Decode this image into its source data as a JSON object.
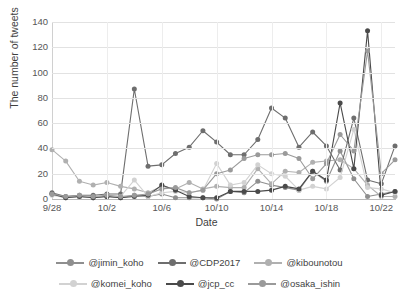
{
  "chart_data": {
    "type": "line",
    "title": "",
    "xlabel": "Date",
    "ylabel": "The number of tweets",
    "ylim": [
      0,
      140
    ],
    "ytick_values": [
      0,
      20,
      40,
      60,
      80,
      100,
      120,
      140
    ],
    "ytick_labels": [
      "0",
      "20",
      "40",
      "60",
      "80",
      "100",
      "120",
      "140"
    ],
    "grid": true,
    "grid_axis": "both",
    "legend_position": "bottom",
    "x": [
      "9/28",
      "9/29",
      "9/30",
      "10/1",
      "10/2",
      "10/3",
      "10/4",
      "10/5",
      "10/6",
      "10/7",
      "10/8",
      "10/9",
      "10/10",
      "10/11",
      "10/12",
      "10/13",
      "10/14",
      "10/15",
      "10/16",
      "10/17",
      "10/18",
      "10/19",
      "10/20",
      "10/21",
      "10/22",
      "10/23"
    ],
    "xtick_labels": [
      "9/28",
      "10/2",
      "10/6",
      "10/10",
      "10/14",
      "10/18",
      "10/22"
    ],
    "xtick_indices": [
      0,
      4,
      8,
      12,
      16,
      20,
      24
    ],
    "series": [
      {
        "name": "@jimin_koho",
        "color": "#8f8f8f",
        "values": [
          4,
          1,
          2,
          1,
          2,
          1,
          3,
          2,
          4,
          1,
          1,
          1,
          0,
          6,
          5,
          14,
          11,
          9,
          7,
          22,
          14,
          38,
          16,
          2,
          4,
          6
        ]
      },
      {
        "name": "@CDP2017",
        "color": "#6e6e6e",
        "values": [
          5,
          2,
          3,
          3,
          4,
          4,
          87,
          26,
          27,
          36,
          41,
          54,
          45,
          35,
          35,
          47,
          72,
          64,
          41,
          53,
          42,
          23,
          64,
          15,
          12,
          42
        ]
      },
      {
        "name": "@kibounotou",
        "color": "#b0b0b0",
        "values": [
          39,
          30,
          14,
          11,
          13,
          10,
          8,
          5,
          10,
          8,
          13,
          8,
          10,
          9,
          9,
          24,
          12,
          22,
          21,
          29,
          30,
          31,
          24,
          11,
          2,
          2
        ]
      },
      {
        "name": "@komei_koho",
        "color": "#d2d2d2",
        "values": [
          3,
          1,
          2,
          1,
          3,
          2,
          15,
          2,
          5,
          6,
          5,
          7,
          28,
          11,
          13,
          27,
          20,
          18,
          7,
          10,
          8,
          17,
          55,
          9,
          8,
          5
        ]
      },
      {
        "name": "@jcp_cc",
        "color": "#4a4a4a",
        "values": [
          4,
          1,
          2,
          1,
          2,
          1,
          2,
          3,
          11,
          7,
          2,
          1,
          1,
          6,
          6,
          6,
          7,
          10,
          8,
          22,
          15,
          76,
          24,
          133,
          3,
          6
        ]
      },
      {
        "name": "@osaka_ishin",
        "color": "#9a9a9a",
        "values": [
          4,
          2,
          3,
          2,
          3,
          2,
          3,
          4,
          8,
          9,
          5,
          7,
          20,
          23,
          32,
          35,
          35,
          36,
          32,
          16,
          28,
          51,
          38,
          117,
          20,
          31
        ]
      }
    ]
  },
  "legend": {
    "rows": [
      [
        {
          "label": "@jimin_koho",
          "color": "#8f8f8f"
        },
        {
          "label": "@CDP2017",
          "color": "#6e6e6e"
        },
        {
          "label": "@kibounotou",
          "color": "#b0b0b0"
        }
      ],
      [
        {
          "label": "@komei_koho",
          "color": "#d2d2d2"
        },
        {
          "label": "@jcp_cc",
          "color": "#4a4a4a"
        },
        {
          "label": "@osaka_ishin",
          "color": "#9a9a9a"
        }
      ]
    ]
  }
}
